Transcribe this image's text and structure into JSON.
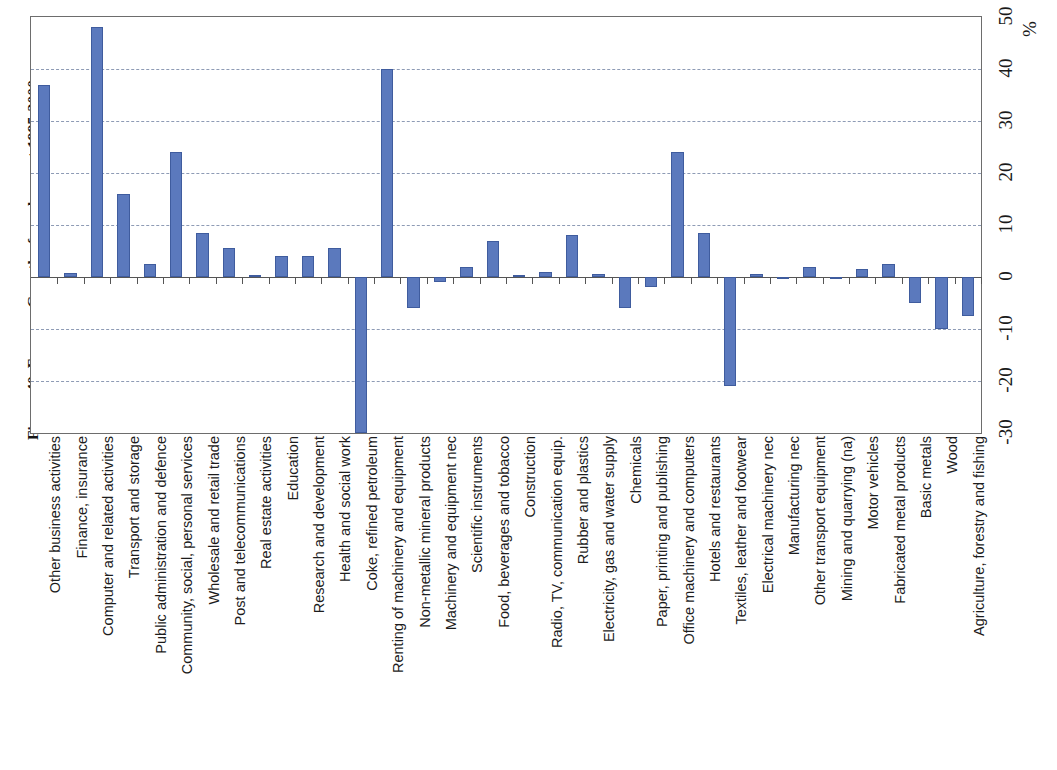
{
  "figure": {
    "title": "Figure 40. France - Growth of employment 1995-2000",
    "percent_symbol": "%"
  },
  "axis": {
    "y_ticks": [
      "-30",
      "-20",
      "-10",
      "0",
      "10",
      "20",
      "30",
      "40",
      "50"
    ],
    "y_min": -30,
    "y_max": 50,
    "gridline_values": [
      40,
      30,
      20,
      10,
      -10,
      -20
    ],
    "zero_value": 0
  },
  "colors": {
    "bar_fill": "#5b79bd",
    "bar_stroke": "#3f5c9e",
    "gridline": "#8e9bb5",
    "axis": "#6d6d6d"
  },
  "chart_data": {
    "type": "bar",
    "title": "Figure 40. France - Growth of employment 1995-2000",
    "xlabel": "",
    "ylabel": "%",
    "ylim": [
      -30,
      50
    ],
    "grid": true,
    "orientation": "vertical",
    "legend": null,
    "categories": [
      "Other business activities",
      "Finance, insurance",
      "Computer and related activities",
      "Transport and storage",
      "Public administration and defence",
      "Community, social, personal services",
      "Wholesale and retail trade",
      "Post and telecommunications",
      "Real estate activities",
      "Education",
      "Research and development",
      "Health and social work",
      "Coke, refined petroleum",
      "Renting of machinery and equipment",
      "Non-metallic mineral products",
      "Machinery and equipment nec",
      "Scientific instruments",
      "Food, beverages and tobacco",
      "Construction",
      "Radio, TV, communication equip.",
      "Rubber and plastics",
      "Electricity, gas and water supply",
      "Chemicals",
      "Paper, printing and publishing",
      "Office machinery and computers",
      "Hotels and restaurants",
      "Textiles, leather and footwear",
      "Electrical machinery nec",
      "Manufacturing nec",
      "Other transport equipment",
      "Mining and quarrying (na)",
      "Motor vehicles",
      "Fabricated metal products",
      "Basic metals",
      "Wood",
      "Agriculture, forestry and fishing"
    ],
    "values": [
      37.0,
      0.8,
      48.0,
      16.0,
      2.5,
      24.0,
      8.5,
      5.5,
      0.3,
      4.0,
      4.0,
      5.5,
      -30.0,
      40.0,
      -6.0,
      -1.0,
      2.0,
      7.0,
      0.3,
      1.0,
      8.0,
      0.5,
      -6.0,
      -2.0,
      24.0,
      8.5,
      -21.0,
      0.5,
      0.0,
      2.0,
      0.0,
      1.5,
      2.5,
      -5.0,
      -10.0,
      -7.5
    ]
  }
}
